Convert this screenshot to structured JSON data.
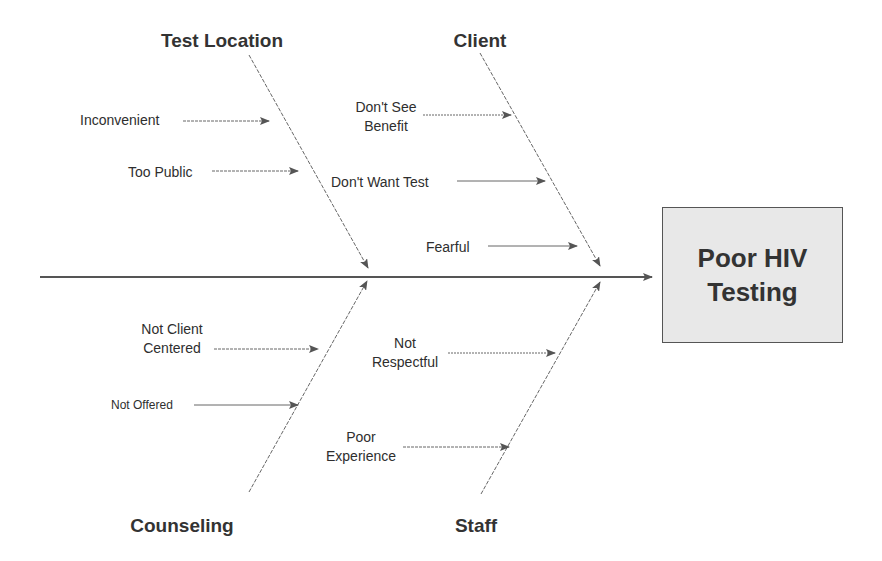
{
  "diagram": {
    "type": "fishbone",
    "effect": {
      "line1": "Poor HIV",
      "line2": "Testing"
    },
    "categories": [
      {
        "name": "Test Location",
        "position": "top-left",
        "causes": [
          {
            "lines": [
              "Inconvenient"
            ]
          },
          {
            "lines": [
              "Too Public"
            ]
          }
        ]
      },
      {
        "name": "Client",
        "position": "top-right",
        "causes": [
          {
            "lines": [
              "Don't See",
              "Benefit"
            ]
          },
          {
            "lines": [
              "Don't Want Test"
            ]
          },
          {
            "lines": [
              "Fearful"
            ]
          }
        ]
      },
      {
        "name": "Counseling",
        "position": "bottom-left",
        "causes": [
          {
            "lines": [
              "Not Client",
              "Centered"
            ]
          },
          {
            "lines": [
              "Not Offered"
            ]
          }
        ]
      },
      {
        "name": "Staff",
        "position": "bottom-right",
        "causes": [
          {
            "lines": [
              "Not",
              "Respectful"
            ]
          },
          {
            "lines": [
              "Poor",
              "Experience"
            ]
          }
        ]
      }
    ],
    "colors": {
      "line": "#555555",
      "box_fill": "#e8e8e8",
      "text": "#333333"
    }
  }
}
